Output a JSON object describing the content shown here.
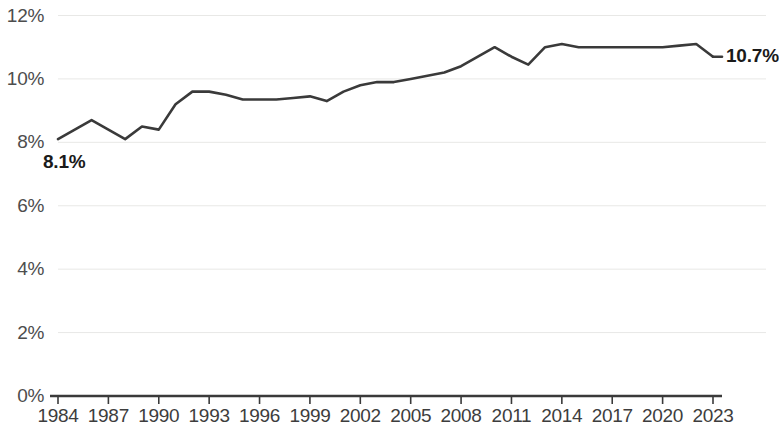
{
  "chart_data": {
    "type": "line",
    "title": "",
    "subtitle": "",
    "xlabel": "",
    "ylabel": "",
    "grid": true,
    "legend": "none",
    "ylim": [
      0,
      12
    ],
    "xlim": [
      1984,
      2023
    ],
    "ytick_labels": [
      "12%",
      "10%",
      "8%",
      "6%",
      "4%",
      "2%",
      "0%"
    ],
    "ytick_values": [
      12,
      10,
      8,
      6,
      4,
      2,
      0
    ],
    "xtick_labels": [
      "1984",
      "1987",
      "1990",
      "1993",
      "1996",
      "1999",
      "2002",
      "2005",
      "2008",
      "2011",
      "2014",
      "2017",
      "2020",
      "2023"
    ],
    "xtick_values": [
      1984,
      1987,
      1990,
      1993,
      1996,
      1999,
      2002,
      2005,
      2008,
      2011,
      2014,
      2017,
      2020,
      2023
    ],
    "x": [
      1984,
      1985,
      1986,
      1987,
      1988,
      1989,
      1990,
      1991,
      1992,
      1993,
      1994,
      1995,
      1996,
      1997,
      1998,
      1999,
      2000,
      2001,
      2002,
      2003,
      2004,
      2005,
      2006,
      2007,
      2008,
      2009,
      2010,
      2011,
      2012,
      2013,
      2014,
      2015,
      2016,
      2017,
      2018,
      2019,
      2020,
      2021,
      2022,
      2023
    ],
    "values": [
      8.1,
      8.4,
      8.7,
      8.4,
      8.1,
      8.5,
      8.4,
      9.2,
      9.6,
      9.6,
      9.5,
      9.35,
      9.35,
      9.35,
      9.4,
      9.45,
      9.3,
      9.6,
      9.8,
      9.9,
      9.9,
      10.0,
      10.1,
      10.2,
      10.4,
      10.7,
      11.0,
      10.7,
      10.45,
      11.0,
      11.1,
      11.0,
      11.0,
      11.0,
      11.0,
      11.0,
      11.0,
      11.05,
      11.1,
      10.7
    ],
    "series": [
      {
        "name": "series-1",
        "color": "#3a3a3a",
        "values": [
          8.1,
          8.4,
          8.7,
          8.4,
          8.1,
          8.5,
          8.4,
          9.2,
          9.6,
          9.6,
          9.5,
          9.35,
          9.35,
          9.35,
          9.4,
          9.45,
          9.3,
          9.6,
          9.8,
          9.9,
          9.9,
          10.0,
          10.1,
          10.2,
          10.4,
          10.7,
          11.0,
          10.7,
          10.45,
          11.0,
          11.1,
          11.0,
          11.0,
          11.0,
          11.0,
          11.0,
          11.0,
          11.05,
          11.1,
          10.7
        ]
      }
    ],
    "annotations": [
      {
        "name": "start-value",
        "text": "8.1%",
        "x": 1984,
        "y": 8.1
      },
      {
        "name": "end-value",
        "text": "10.7%",
        "x": 2023,
        "y": 10.7
      }
    ],
    "colors": {
      "line": "#3a3a3a",
      "axis": "#3a3a3a",
      "grid": "#e8e8e6",
      "tick_label": "#4d4d4d",
      "annotation": "#1a1a1a",
      "background": "#ffffff"
    }
  }
}
